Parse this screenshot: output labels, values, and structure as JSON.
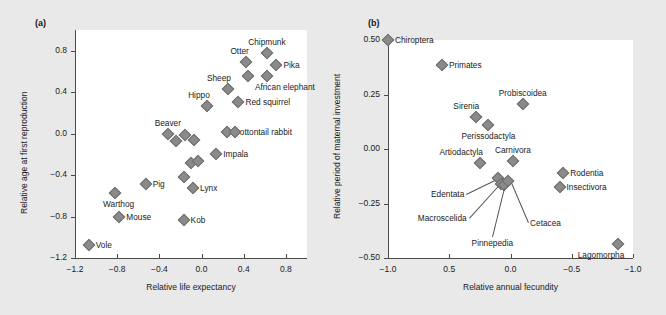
{
  "figure": {
    "background_color": "#e9e9e9",
    "plot_background_color": "#ffffff",
    "marker_color": "#8a8a8a",
    "axis_color": "#4a4a4a",
    "text_color": "#1a1a1a"
  },
  "panels": {
    "a": {
      "tag": "(a)"
    },
    "b": {
      "tag": "(b)"
    }
  },
  "chart_data": [
    {
      "type": "scatter",
      "panel": "(a)",
      "title": "",
      "xlabel": "Relative life expectancy",
      "ylabel": "Relative age at first reproduction",
      "xlim": [
        -1.2,
        1.0
      ],
      "ylim": [
        -1.2,
        1.0
      ],
      "xticks": [
        -1.2,
        -0.8,
        -0.4,
        0.0,
        0.4,
        0.8
      ],
      "xticklabels": [
        "−1.2",
        "−0.8",
        "−0.4",
        "0.0",
        "0.4",
        "0.8"
      ],
      "yticks": [
        0.8,
        0.4,
        0.0,
        -0.4,
        -0.8,
        -1.2
      ],
      "yticklabels": [
        "0.8",
        "0.4",
        "0.0",
        "−0.4",
        "−0.8",
        "−1.2"
      ],
      "x_axis_reversed": false,
      "grid": false,
      "legend": "none",
      "points": [
        {
          "label": "Chipmunk",
          "x": 0.62,
          "y": 0.78,
          "label_pos": "above"
        },
        {
          "label": "Otter",
          "x": 0.42,
          "y": 0.69,
          "label_pos": "above-left"
        },
        {
          "label": "Pika",
          "x": 0.71,
          "y": 0.66,
          "label_pos": "right"
        },
        {
          "label": "",
          "x": 0.44,
          "y": 0.56,
          "label_pos": "none"
        },
        {
          "label": "African elephant",
          "x": 0.62,
          "y": 0.56,
          "label_pos": "below-right"
        },
        {
          "label": "Sheep",
          "x": 0.25,
          "y": 0.43,
          "label_pos": "above-left"
        },
        {
          "label": "Red squirrel",
          "x": 0.35,
          "y": 0.31,
          "label_pos": "right"
        },
        {
          "label": "Hippo",
          "x": 0.05,
          "y": 0.27,
          "label_pos": "above-left"
        },
        {
          "label": "Cottontail rabbit",
          "x": 0.24,
          "y": 0.02,
          "label_pos": "right"
        },
        {
          "label": "",
          "x": 0.32,
          "y": 0.02,
          "label_pos": "none"
        },
        {
          "label": "Beaver",
          "x": -0.32,
          "y": 0.0,
          "label_pos": "above"
        },
        {
          "label": "",
          "x": -0.16,
          "y": -0.01,
          "label_pos": "none"
        },
        {
          "label": "",
          "x": -0.24,
          "y": -0.07,
          "label_pos": "none"
        },
        {
          "label": "",
          "x": -0.07,
          "y": -0.06,
          "label_pos": "none"
        },
        {
          "label": "Impala",
          "x": 0.14,
          "y": -0.2,
          "label_pos": "right"
        },
        {
          "label": "",
          "x": -0.1,
          "y": -0.28,
          "label_pos": "none"
        },
        {
          "label": "",
          "x": -0.03,
          "y": -0.26,
          "label_pos": "none"
        },
        {
          "label": "",
          "x": -0.17,
          "y": -0.42,
          "label_pos": "none"
        },
        {
          "label": "Pig",
          "x": -0.53,
          "y": -0.49,
          "label_pos": "right"
        },
        {
          "label": "Lynx",
          "x": -0.08,
          "y": -0.52,
          "label_pos": "right"
        },
        {
          "label": "Warthog",
          "x": -0.82,
          "y": -0.57,
          "label_pos": "below-right"
        },
        {
          "label": "Mouse",
          "x": -0.78,
          "y": -0.8,
          "label_pos": "right"
        },
        {
          "label": "Kob",
          "x": -0.17,
          "y": -0.83,
          "label_pos": "right"
        },
        {
          "label": "Vole",
          "x": -1.07,
          "y": -1.07,
          "label_pos": "right"
        }
      ]
    },
    {
      "type": "scatter",
      "panel": "(b)",
      "title": "",
      "xlabel": "Relative annual fecundity",
      "ylabel": "Relative period of maternal investment",
      "xlim": [
        1.0,
        -1.0
      ],
      "ylim": [
        -0.5,
        0.5
      ],
      "xticks": [
        1.0,
        0.5,
        0.0,
        -0.5,
        -1.0
      ],
      "xticklabels": [
        "−1.0",
        "0.5",
        "0.0",
        "−0.5",
        "−1.0"
      ],
      "yticks": [
        0.5,
        0.25,
        0.0,
        -0.25,
        -0.5
      ],
      "yticklabels": [
        "0.50",
        "0.25",
        "0.00",
        "−0.25",
        "−0.50"
      ],
      "x_axis_reversed": true,
      "grid": false,
      "legend": "none",
      "points": [
        {
          "label": "Chiroptera",
          "x": 1.0,
          "y": 0.5,
          "label_pos": "right"
        },
        {
          "label": "Primates",
          "x": 0.56,
          "y": 0.385,
          "label_pos": "right"
        },
        {
          "label": "Probiscoidea",
          "x": -0.1,
          "y": 0.205,
          "label_pos": "above"
        },
        {
          "label": "Sirenia",
          "x": 0.28,
          "y": 0.145,
          "label_pos": "above-left"
        },
        {
          "label": "Perissodactyla",
          "x": 0.18,
          "y": 0.11,
          "label_pos": "below"
        },
        {
          "label": "Artiodactyla",
          "x": 0.25,
          "y": -0.065,
          "label_pos": "above-left"
        },
        {
          "label": "Carnivora",
          "x": -0.02,
          "y": -0.055,
          "label_pos": "above"
        },
        {
          "label": "Rodentia",
          "x": -0.43,
          "y": -0.11,
          "label_pos": "right"
        },
        {
          "label": "Insectivora",
          "x": -0.4,
          "y": -0.175,
          "label_pos": "right"
        },
        {
          "label": "Edentata",
          "x": 0.1,
          "y": -0.135,
          "label_pos": "leader-left"
        },
        {
          "label": "Macroscelida",
          "x": 0.08,
          "y": -0.16,
          "label_pos": "leader-left"
        },
        {
          "label": "Pinnepedia",
          "x": 0.05,
          "y": -0.165,
          "label_pos": "leader-below"
        },
        {
          "label": "Cetacea",
          "x": 0.02,
          "y": -0.145,
          "label_pos": "leader-right"
        },
        {
          "label": "Lagomorpha",
          "x": -0.88,
          "y": -0.435,
          "label_pos": "below-left"
        }
      ]
    }
  ]
}
